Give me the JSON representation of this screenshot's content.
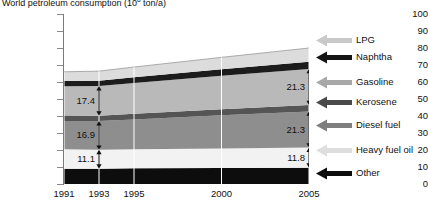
{
  "chart_data": {
    "type": "area",
    "title_main": "World petroleum consumption (10",
    "title_sup": "8",
    "title_tail": " ton/a)",
    "xlabel": "",
    "ylabel": "",
    "categories": [
      "1991",
      "1993",
      "1995",
      "2000",
      "2005"
    ],
    "x": [
      1991,
      1993,
      1995,
      2000,
      2005
    ],
    "ylim": [
      0,
      100
    ],
    "xlim": [
      1991,
      2005
    ],
    "yticks": [
      0,
      10,
      20,
      30,
      40,
      50,
      60,
      70,
      80,
      90,
      100
    ],
    "grid": "vertical-white-gridlines",
    "legend_position": "right",
    "stack_order_bottom_to_top": [
      "Other",
      "Heavy fuel oil",
      "Diesel fuel",
      "Kerosene",
      "Gasoline",
      "Naphtha",
      "LPG"
    ],
    "series": [
      {
        "name": "Other",
        "color": "#0d0d0d",
        "values": [
          9.0,
          9.0,
          9.2,
          9.4,
          9.6
        ]
      },
      {
        "name": "Heavy fuel oil",
        "color": "#f2f2f2",
        "values": [
          11.5,
          11.1,
          11.2,
          11.5,
          11.8
        ]
      },
      {
        "name": "Diesel fuel",
        "color": "#8e8e8e",
        "values": [
          16.6,
          16.9,
          17.6,
          19.5,
          21.3
        ]
      },
      {
        "name": "Kerosene",
        "color": "#555555",
        "values": [
          3.2,
          3.2,
          3.3,
          3.5,
          3.7
        ]
      },
      {
        "name": "Gasoline",
        "color": "#b9b9b9",
        "values": [
          17.2,
          17.4,
          18.1,
          19.8,
          21.3
        ]
      },
      {
        "name": "Naphtha",
        "color": "#1c1c1c",
        "values": [
          3.1,
          3.2,
          3.4,
          3.8,
          4.2
        ]
      },
      {
        "name": "LPG",
        "color": "#dcdcdc",
        "values": [
          5.4,
          5.6,
          6.0,
          7.0,
          8.1
        ]
      }
    ],
    "totals": [
      66.0,
      66.4,
      68.8,
      74.5,
      80.0
    ],
    "annotations": [
      {
        "id": "gasoline-1993",
        "label": "17.4",
        "series": "Gasoline",
        "year": 1993
      },
      {
        "id": "diesel-1993",
        "label": "16.9",
        "series": "Diesel fuel",
        "year": 1993
      },
      {
        "id": "heavyoil-1993",
        "label": "11.1",
        "series": "Heavy fuel oil",
        "year": 1993
      },
      {
        "id": "gasoline-2005",
        "label": "21.3",
        "series": "Gasoline",
        "year": 2005
      },
      {
        "id": "diesel-2005",
        "label": "21.3",
        "series": "Diesel fuel",
        "year": 2005
      },
      {
        "id": "heavyoil-2005",
        "label": "11.8",
        "series": "Heavy fuel oil",
        "year": 2005
      }
    ],
    "legend": [
      {
        "label": "LPG",
        "color": "#c9c9c9"
      },
      {
        "label": "Naphtha",
        "color": "#151515"
      },
      {
        "label": "Gasoline",
        "color": "#a8a8a8"
      },
      {
        "label": "Kerosene",
        "color": "#4a4a4a"
      },
      {
        "label": "Diesel fuel",
        "color": "#7e7e7e"
      },
      {
        "label": "Heavy fuel oil",
        "color": "#dedede"
      },
      {
        "label": "Other",
        "color": "#0d0d0d"
      }
    ]
  },
  "axis": {
    "y_labels": [
      "100",
      "90",
      "80",
      "70",
      "60",
      "50",
      "40",
      "30",
      "20",
      "10",
      "0"
    ],
    "x_labels": [
      "1991",
      "1993",
      "1995",
      "2000",
      "2005"
    ]
  }
}
